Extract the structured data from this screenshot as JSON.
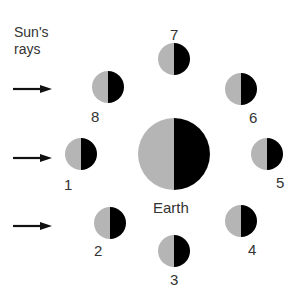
{
  "sun": {
    "label_line1": "Sun's",
    "label_line2": "rays",
    "arrows": [
      {
        "y": 89
      },
      {
        "y": 158
      },
      {
        "y": 226
      }
    ]
  },
  "earth": {
    "label": "Earth",
    "cx": 174,
    "cy": 154,
    "r": 36
  },
  "colors": {
    "lit": "#b5b5b5",
    "dark": "#000000",
    "text": "#333333",
    "arrow": "#111111"
  },
  "moons": [
    {
      "id": "1",
      "label": "1",
      "cx": 81,
      "cy": 154,
      "r": 16,
      "lx": 68,
      "ly": 185
    },
    {
      "id": "2",
      "label": "2",
      "cx": 110,
      "cy": 223,
      "r": 16,
      "lx": 98,
      "ly": 251
    },
    {
      "id": "3",
      "label": "3",
      "cx": 174,
      "cy": 251,
      "r": 16,
      "lx": 174,
      "ly": 280
    },
    {
      "id": "4",
      "label": "4",
      "cx": 241,
      "cy": 221,
      "r": 16,
      "lx": 252,
      "ly": 250
    },
    {
      "id": "5",
      "label": "5",
      "cx": 267,
      "cy": 154,
      "r": 16,
      "lx": 280,
      "ly": 183
    },
    {
      "id": "6",
      "label": "6",
      "cx": 241,
      "cy": 89,
      "r": 16,
      "lx": 253,
      "ly": 118
    },
    {
      "id": "7",
      "label": "7",
      "cx": 174,
      "cy": 59,
      "r": 16,
      "lx": 174,
      "ly": 35
    },
    {
      "id": "8",
      "label": "8",
      "cx": 108,
      "cy": 87,
      "r": 16,
      "lx": 95,
      "ly": 117
    }
  ]
}
